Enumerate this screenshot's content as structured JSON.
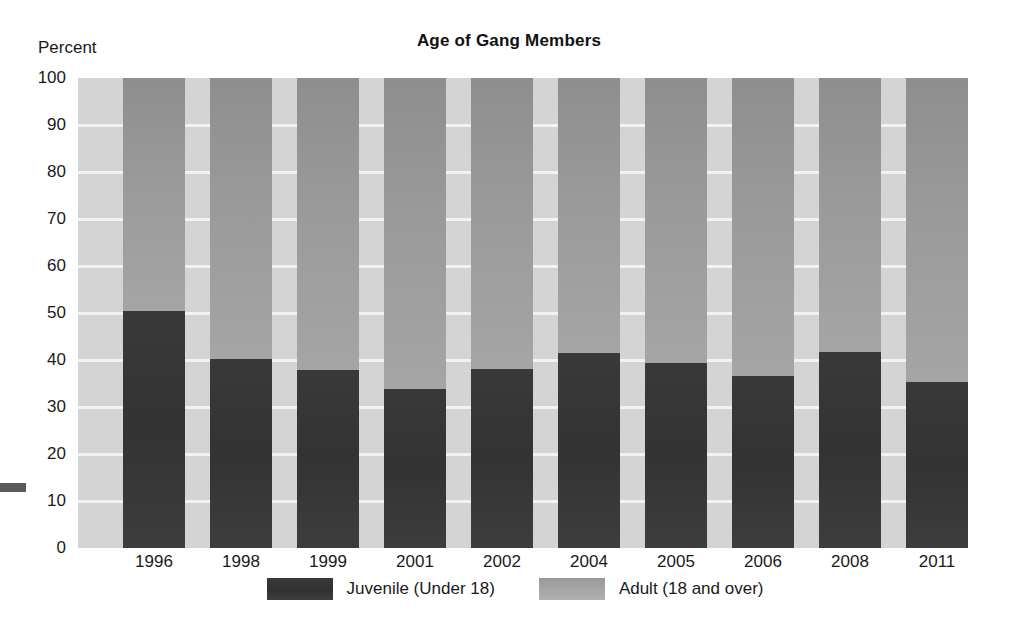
{
  "chart_data": {
    "type": "bar",
    "stacked": true,
    "title": "Age of Gang Members",
    "xlabel": "",
    "ylabel": "Percent",
    "ylim": [
      0,
      100
    ],
    "ytick_labels": [
      "100",
      "90",
      "80",
      "70",
      "60",
      "50",
      "40",
      "30",
      "20",
      "10",
      "0"
    ],
    "ytick_values": [
      100,
      90,
      80,
      70,
      60,
      50,
      40,
      30,
      20,
      10,
      0
    ],
    "grid": true,
    "legend_position": "bottom-center",
    "categories": [
      "1996",
      "1998",
      "1999",
      "2001",
      "2002",
      "2004",
      "2005",
      "2006",
      "2008",
      "2011"
    ],
    "series": [
      {
        "name": "Juvenile (Under 18)",
        "color": "#363636",
        "values": [
          50.4,
          40.2,
          37.9,
          33.8,
          38.1,
          41.4,
          39.3,
          36.6,
          41.8,
          35.4
        ]
      },
      {
        "name": "Adult (18 and over)",
        "color": "#9c9c9c",
        "values": [
          49.6,
          59.8,
          62.1,
          66.2,
          61.9,
          58.6,
          60.7,
          63.4,
          58.2,
          64.6
        ]
      }
    ]
  },
  "axis": {
    "y_caption": "Percent"
  },
  "legend": {
    "items": [
      {
        "label": "Juvenile (Under 18)",
        "swatch": "dark-gray-swatch"
      },
      {
        "label": "Adult (18 and over)",
        "swatch": "light-gray-swatch"
      }
    ]
  },
  "colors": {
    "juvenile": "#363636",
    "adult": "#9c9c9c",
    "plot_background": "#cfcfcf",
    "gridline": "#f2f2f2",
    "page_background": "#ffffff"
  }
}
